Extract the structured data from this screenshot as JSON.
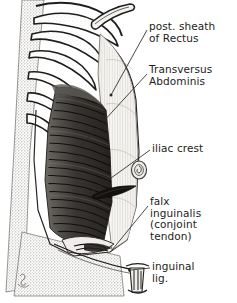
{
  "figure": {
    "style": "grayscale pen-and-ink anatomical illustration with stipple shading",
    "signature": "artist monogram, lower left",
    "colors": {
      "background": "#ffffff",
      "paper_stipple": "#b9b7b2",
      "ink": "#1d1c1a",
      "muscle_dark": "#2a2724",
      "sheath_light": "#f3f1ee",
      "mid_gray": "#8c8a85"
    }
  },
  "labels": [
    {
      "id": "post-sheath",
      "lines": "post. sheath\nof Rectus",
      "target": "posterior sheath of rectus abdominis"
    },
    {
      "id": "transversus",
      "lines": "Transversus\nAbdominis",
      "target": "transversus abdominis muscle"
    },
    {
      "id": "iliac-crest",
      "lines": "iliac crest",
      "target": "iliac crest"
    },
    {
      "id": "falx-inguinalis",
      "lines": "falx\ninguinalis\n(conjoint\ntendon)",
      "target": "falx inguinalis / conjoint tendon"
    },
    {
      "id": "inguinal-lig",
      "lines": "inguinal\nlig.",
      "target": "inguinal ligament"
    }
  ],
  "structures": [
    {
      "name": "ribs",
      "note": "costal cartilages and lower ribs, upper left"
    },
    {
      "name": "costal-margin",
      "note": "curved costal arch"
    },
    {
      "name": "muscle-fibers",
      "note": "horizontal transversus abdominis fibers"
    },
    {
      "name": "rectus-sheath-panel",
      "note": "pale vertically striated sheath, right of midline"
    },
    {
      "name": "umbilicus",
      "note": "small spiral ring at iliac crest leader"
    },
    {
      "name": "deep-inguinal-ring",
      "note": "dark lens-shaped slit"
    },
    {
      "name": "inguinal-ligament-cord",
      "note": "vertical cord structure at lower midline"
    }
  ]
}
